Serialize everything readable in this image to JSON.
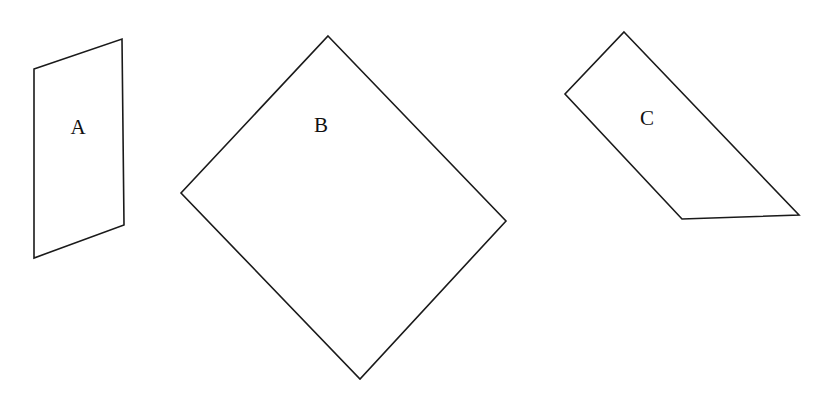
{
  "diagram": {
    "stroke_color": "#1a1a1a",
    "shapes": [
      {
        "id": "A",
        "label": "A",
        "kind": "parallelogram",
        "points": "34,69 122,39 124,225 34,258",
        "label_pos": {
          "x": 78,
          "y": 129
        }
      },
      {
        "id": "B",
        "label": "B",
        "kind": "rotated-square",
        "points": "328,36 506,221 360,379 181,193",
        "label_pos": {
          "x": 321,
          "y": 127
        }
      },
      {
        "id": "C",
        "label": "C",
        "kind": "quadrilateral",
        "points": "624,32 799,215 682,219 565,94",
        "label_pos": {
          "x": 647,
          "y": 120
        }
      }
    ]
  }
}
